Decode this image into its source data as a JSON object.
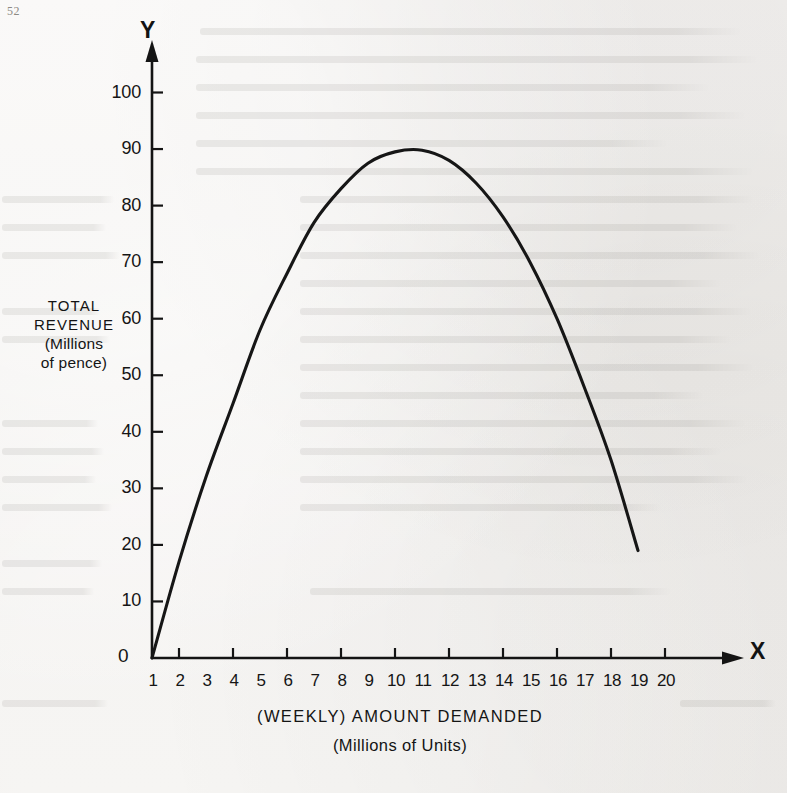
{
  "page": {
    "number": "52"
  },
  "axes": {
    "y_letter": "Y",
    "x_letter": "X",
    "origin_label": "0",
    "y_title_lines": [
      "TOTAL",
      "REVENUE",
      "(Millions",
      "of pence)"
    ],
    "x_title_lines": [
      "(WEEKLY) AMOUNT DEMANDED",
      "(Millions of Units)"
    ],
    "y_tick_labels": [
      "100",
      "90",
      "80",
      "70",
      "60",
      "50",
      "40",
      "30",
      "20",
      "10"
    ],
    "x_tick_labels": [
      "1",
      "2",
      "3",
      "4",
      "5",
      "6",
      "7",
      "8",
      "9",
      "10",
      "11",
      "12",
      "13",
      "14",
      "15",
      "16",
      "17",
      "18",
      "19",
      "20"
    ]
  },
  "chart_data": {
    "type": "line",
    "title": "",
    "subtitle": "",
    "xlabel": "(WEEKLY) AMOUNT DEMANDED (Millions of Units)",
    "ylabel": "TOTAL REVENUE (Millions of pence)",
    "xlim": [
      0,
      20
    ],
    "ylim": [
      0,
      105
    ],
    "xticks": [
      1,
      2,
      3,
      4,
      5,
      6,
      7,
      8,
      9,
      10,
      11,
      12,
      13,
      14,
      15,
      16,
      17,
      18,
      19,
      20
    ],
    "yticks": [
      0,
      10,
      20,
      30,
      40,
      50,
      60,
      70,
      80,
      90,
      100
    ],
    "grid": false,
    "legend": "none",
    "series": [
      {
        "name": "Total revenue",
        "x": [
          0,
          1,
          2,
          3,
          4,
          5,
          6,
          7,
          8,
          9,
          10,
          11,
          12,
          13,
          14,
          15,
          16,
          17,
          18
        ],
        "y": [
          0,
          17,
          32,
          45,
          58,
          68,
          77,
          83,
          87.5,
          89.5,
          89.8,
          88,
          84,
          78,
          70,
          60,
          48,
          35,
          19
        ]
      }
    ],
    "annotations": [
      {
        "text": "curve peak",
        "x": 10,
        "y": 89.8
      }
    ]
  },
  "bleed_lines": [
    {
      "x": 200,
      "y": 28,
      "w": 540
    },
    {
      "x": 196,
      "y": 56,
      "w": 560
    },
    {
      "x": 196,
      "y": 84,
      "w": 512
    },
    {
      "x": 196,
      "y": 112,
      "w": 548
    },
    {
      "x": 196,
      "y": 140,
      "w": 470
    },
    {
      "x": 196,
      "y": 168,
      "w": 556
    },
    {
      "x": 2,
      "y": 196,
      "w": 112
    },
    {
      "x": 2,
      "y": 224,
      "w": 104
    },
    {
      "x": 2,
      "y": 252,
      "w": 118
    },
    {
      "x": 300,
      "y": 196,
      "w": 452
    },
    {
      "x": 300,
      "y": 224,
      "w": 436
    },
    {
      "x": 300,
      "y": 252,
      "w": 458
    },
    {
      "x": 300,
      "y": 280,
      "w": 420
    },
    {
      "x": 300,
      "y": 308,
      "w": 450
    },
    {
      "x": 300,
      "y": 336,
      "w": 430
    },
    {
      "x": 300,
      "y": 364,
      "w": 452
    },
    {
      "x": 300,
      "y": 392,
      "w": 402
    },
    {
      "x": 300,
      "y": 420,
      "w": 444
    },
    {
      "x": 300,
      "y": 448,
      "w": 420
    },
    {
      "x": 300,
      "y": 476,
      "w": 446
    },
    {
      "x": 300,
      "y": 504,
      "w": 360
    },
    {
      "x": 2,
      "y": 308,
      "w": 98
    },
    {
      "x": 2,
      "y": 336,
      "w": 108
    },
    {
      "x": 2,
      "y": 420,
      "w": 96
    },
    {
      "x": 2,
      "y": 448,
      "w": 102
    },
    {
      "x": 2,
      "y": 476,
      "w": 94
    },
    {
      "x": 2,
      "y": 504,
      "w": 110
    },
    {
      "x": 2,
      "y": 560,
      "w": 100
    },
    {
      "x": 2,
      "y": 588,
      "w": 92
    },
    {
      "x": 310,
      "y": 588,
      "w": 360
    },
    {
      "x": 2,
      "y": 700,
      "w": 106
    },
    {
      "x": 680,
      "y": 700,
      "w": 96
    }
  ]
}
